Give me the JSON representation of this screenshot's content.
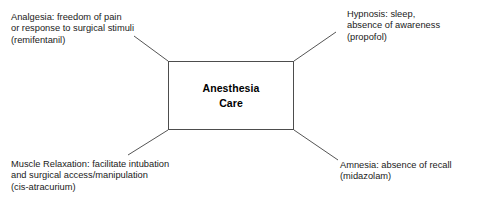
{
  "diagram": {
    "type": "hub-and-spoke",
    "center": {
      "name": "anesthesia-care-node",
      "lines": [
        "Anesthesia",
        "Care"
      ]
    },
    "branches": [
      {
        "id": "analgesia",
        "position": "top-left",
        "lines": [
          "Analgesia:  freedom of pain",
          "or response to surgical stimuli",
          "(remifentanil)"
        ],
        "connector": {
          "x1": 134,
          "y1": 36,
          "x2": 168,
          "y2": 61
        }
      },
      {
        "id": "hypnosis",
        "position": "top-right",
        "lines": [
          "Hypnosis:  sleep,",
          "absence of awareness",
          "(propofol)"
        ],
        "connector": {
          "x1": 336,
          "y1": 32,
          "x2": 294,
          "y2": 61
        }
      },
      {
        "id": "muscle-relaxation",
        "position": "bottom-left",
        "lines": [
          "Muscle Relaxation:  facilitate intubation",
          "and surgical access/manipulation",
          "(cis-atracurium)"
        ],
        "connector": {
          "x1": 128,
          "y1": 155,
          "x2": 168,
          "y2": 130
        }
      },
      {
        "id": "amnesia",
        "position": "bottom-right",
        "lines": [
          "Amnesia:  absence of recall",
          "(midazolam)"
        ],
        "connector": {
          "x1": 338,
          "y1": 160,
          "x2": 294,
          "y2": 130
        }
      }
    ],
    "colors": {
      "background": "#ffffff",
      "border": "#4d4d4d",
      "connector": "#555555",
      "text": "#1a1a1a",
      "center_text": "#000000"
    }
  }
}
